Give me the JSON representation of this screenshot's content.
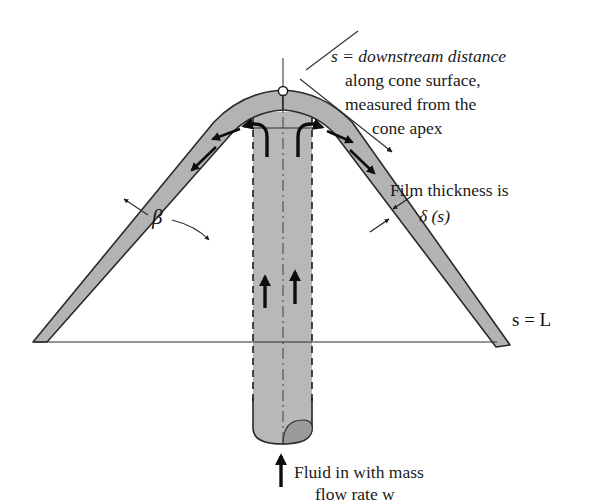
{
  "figure": {
    "background_color": "#ffffff",
    "ink_color": "#1a1a1a",
    "film_fill_color": "#b3b3b3",
    "tube_fill_color": "#b8b8b8",
    "apex_marker_color": "#ffffff"
  },
  "annotations": {
    "downstream_distance": {
      "line1": "s = downstream distance",
      "line2": "along cone surface,",
      "line3": "measured from the",
      "line4": "cone apex"
    },
    "film_thickness": {
      "line1": "Film thickness is",
      "line2": "δ (s)"
    },
    "cone_angle": "β",
    "slant_length": "s = L",
    "inlet": {
      "line1": "Fluid in with mass",
      "line2": "flow rate w"
    }
  },
  "icons": {
    "apex_point": "apex-point-icon",
    "inlet_arrow": "up-arrow-icon",
    "feed_arrow_left": "up-arrow-icon",
    "feed_arrow_right": "up-arrow-icon",
    "split_arrow_left": "curved-arrow-left-icon",
    "split_arrow_right": "curved-arrow-right-icon",
    "film_arrow_left": "down-left-arrow-icon",
    "film_arrow_right": "down-right-arrow-icon",
    "thickness_caliper": "double-arrow-icon",
    "beta_pointer": "leader-arrow-icon",
    "downstream_pointer": "leader-arrow-icon"
  },
  "geometry": {
    "apex": {
      "x": 283,
      "y": 90
    },
    "base_left": {
      "x": 33,
      "y": 342
    },
    "base_right": {
      "x": 497,
      "y": 342
    },
    "right_tip": {
      "x": 510,
      "y": 345
    },
    "tube_left_x": 253,
    "tube_right_x": 312,
    "tube_bottom_y": 440,
    "centerline_x": 283,
    "axis_top_y": 58
  }
}
